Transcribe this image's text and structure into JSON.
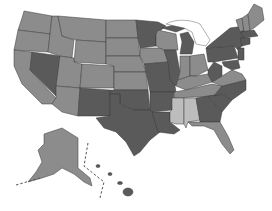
{
  "map": {
    "title": "",
    "type": "choropleth",
    "region": "United States",
    "colors": {
      "dark": "#5a5a5a",
      "medium": "#8c8c8c",
      "light": "#bdbdbd",
      "water": "#ffffff",
      "border": "#3a3a3a"
    },
    "categories": {
      "dark": [
        "NV",
        "NM",
        "TX",
        "OK",
        "AR",
        "LA",
        "MN",
        "IL",
        "MI",
        "MO",
        "TN",
        "GA",
        "SC",
        "NC",
        "WV",
        "PA",
        "NY",
        "NJ",
        "MD",
        "DE",
        "MA",
        "CT",
        "RI",
        "VA",
        "HI"
      ],
      "medium": [
        "WA",
        "OR",
        "CA",
        "ID",
        "MT",
        "WY",
        "UT",
        "CO",
        "AZ",
        "ND",
        "SD",
        "NE",
        "KS",
        "IA",
        "WI",
        "IN",
        "OH",
        "KY",
        "FL",
        "ME",
        "VT",
        "NH",
        "AK"
      ],
      "light": [
        "MS",
        "AL"
      ]
    },
    "insets": [
      "Alaska",
      "Hawaii"
    ]
  }
}
